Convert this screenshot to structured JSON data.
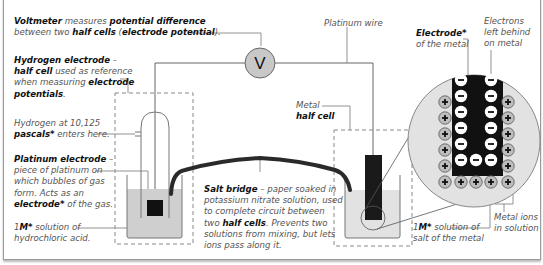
{
  "labels": {
    "voltmeter": {
      "line1_bold1": "Voltmeter",
      "line1_text1": " measures ",
      "line1_bold2": "potential difference",
      "line2_text1": "between two ",
      "line2_bold1": "half cells",
      "line2_text2": " (",
      "line2_bold2": "electrode potential",
      "line2_text3": ")."
    },
    "voltmeter_symbol": "V",
    "hydrogen_electrode": {
      "line1_bold": "Hydrogen electrode",
      "line1_text": " –",
      "line2_bold": "half cell",
      "line2_text": " used as reference",
      "line3_text": "when measuring ",
      "line3_bold": "electrode",
      "line4_bold": "potentials",
      "line4_text": "."
    },
    "hydrogen_gas": {
      "line1_text": "Hydrogen at 10,125",
      "line2_bold": "pascals*",
      "line2_text": " enters here."
    },
    "platinum_electrode": {
      "line1_bold": "Platinum electrode",
      "line1_text": " –",
      "line2_text": "piece of platinum on",
      "line3_text": "which bubbles of gas",
      "line4_text": "form. Acts as an",
      "line5_bold": "electrode*",
      "line5_text": " of the gas."
    },
    "hcl_solution": {
      "line1_text1": "1",
      "line1_bold": "M*",
      "line1_text2": " solution of",
      "line2_text": "hydrochloric acid."
    },
    "platinum_wire": "Platinum wire",
    "metal_half_cell": {
      "line1_text": "Metal",
      "line2_bold": "half cell"
    },
    "salt_bridge": {
      "line1_bold": "Salt bridge",
      "line1_text": " – paper soaked in",
      "line2_text": "potassium nitrate solution, used",
      "line3_text": "to complete circuit between",
      "line4_text1": "two ",
      "line4_bold": "half cells",
      "line4_text2": ". Prevents two",
      "line5_text": "solutions from mixing, but lets",
      "line6_text": "ions pass along it."
    },
    "electrode_metal": {
      "line1_bold": "Electrode*",
      "line2_text": "of the metal"
    },
    "electrons": {
      "line1": "Electrons",
      "line2": "left behind",
      "line3": "on metal"
    },
    "metal_salt_solution": {
      "line1_text1": "1",
      "line1_bold": "M*",
      "line1_text2": " solution of",
      "line2_text": "salt of the metal"
    },
    "metal_ions": {
      "line1": "Metal ions",
      "line2": "in solution"
    }
  },
  "magnified_view": {
    "negative_charge_count": 13,
    "positive_charge_count": 13,
    "negative_symbol": "−",
    "positive_symbol": "+"
  },
  "colors": {
    "solution": "#cfcfcf",
    "metal_solution": "#e2e2e2",
    "voltmeter_fill": "#c8c8c8",
    "electrode": "#111111",
    "line": "#666666"
  }
}
